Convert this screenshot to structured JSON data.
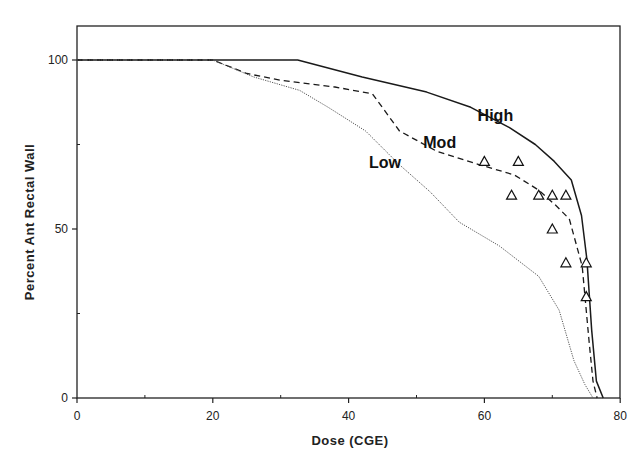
{
  "chart_data": {
    "type": "line",
    "title": "",
    "xlabel": "Dose  (CGE)",
    "ylabel": "Percent  Ant  Rectal  Wall",
    "xlim": [
      0,
      80
    ],
    "ylim": [
      0,
      110
    ],
    "x_ticks": [
      0,
      20,
      40,
      60,
      80
    ],
    "x_tick_labels": [
      "0",
      "20",
      "40",
      "60",
      "80"
    ],
    "y_ticks": [
      0,
      50,
      100
    ],
    "y_tick_labels": [
      "0",
      "50",
      "100"
    ],
    "grid": false,
    "legend": "inline labels",
    "series": [
      {
        "name": "High",
        "style": "solid",
        "points": [
          [
            0,
            100
          ],
          [
            32.5,
            100
          ],
          [
            42,
            95
          ],
          [
            51.5,
            90.5
          ],
          [
            58,
            86
          ],
          [
            63.7,
            80
          ],
          [
            67.5,
            75
          ],
          [
            70.3,
            70
          ],
          [
            72.8,
            64.5
          ],
          [
            74.3,
            54
          ],
          [
            75.1,
            41
          ],
          [
            75.8,
            20
          ],
          [
            76.5,
            5
          ],
          [
            77.5,
            0
          ]
        ]
      },
      {
        "name": "Mod",
        "style": "dashed",
        "points": [
          [
            0,
            100
          ],
          [
            20,
            100
          ],
          [
            25,
            96
          ],
          [
            30,
            94
          ],
          [
            38,
            92
          ],
          [
            43.5,
            90
          ],
          [
            47.5,
            79
          ],
          [
            53,
            73
          ],
          [
            59.3,
            69
          ],
          [
            64.4,
            66
          ],
          [
            68,
            61.5
          ],
          [
            70.5,
            57
          ],
          [
            72.5,
            53
          ],
          [
            74.4,
            39
          ],
          [
            75.4,
            17
          ],
          [
            76,
            5
          ],
          [
            76.6,
            0
          ]
        ]
      },
      {
        "name": "Low",
        "style": "dotted",
        "points": [
          [
            0,
            100
          ],
          [
            20,
            100
          ],
          [
            26,
            95
          ],
          [
            32.8,
            91
          ],
          [
            37,
            86
          ],
          [
            42.5,
            79
          ],
          [
            47.5,
            69
          ],
          [
            52,
            61
          ],
          [
            56.3,
            52
          ],
          [
            62.2,
            45
          ],
          [
            68,
            36
          ],
          [
            71,
            26
          ],
          [
            73.2,
            11
          ],
          [
            74.8,
            4
          ],
          [
            76,
            0
          ]
        ]
      }
    ],
    "scatter": {
      "name": "Observed",
      "marker": "triangle-open",
      "points": [
        [
          60,
          70
        ],
        [
          65,
          70
        ],
        [
          64,
          60
        ],
        [
          68,
          60
        ],
        [
          70,
          60
        ],
        [
          72,
          60
        ],
        [
          70,
          50
        ],
        [
          72,
          40
        ],
        [
          75,
          40
        ],
        [
          75,
          30
        ]
      ]
    },
    "annotations": [
      {
        "text": "High",
        "x": 59,
        "y": 82
      },
      {
        "text": "Mod",
        "x": 51,
        "y": 74
      },
      {
        "text": "Low",
        "x": 43,
        "y": 68
      }
    ]
  }
}
